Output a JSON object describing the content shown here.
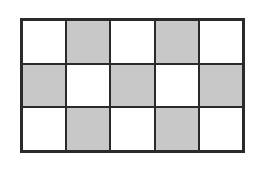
{
  "diagram": {
    "type": "grid",
    "rows": 3,
    "columns": 5,
    "colors": {
      "shaded": "#c8c8c8",
      "unshaded": "#ffffff",
      "border": "#2a2a2a"
    },
    "cells": [
      [
        "white",
        "shaded",
        "white",
        "shaded",
        "white"
      ],
      [
        "shaded",
        "white",
        "shaded",
        "white",
        "shaded"
      ],
      [
        "white",
        "shaded",
        "white",
        "shaded",
        "white"
      ]
    ],
    "shaded_count": 7,
    "total_cells": 15
  }
}
